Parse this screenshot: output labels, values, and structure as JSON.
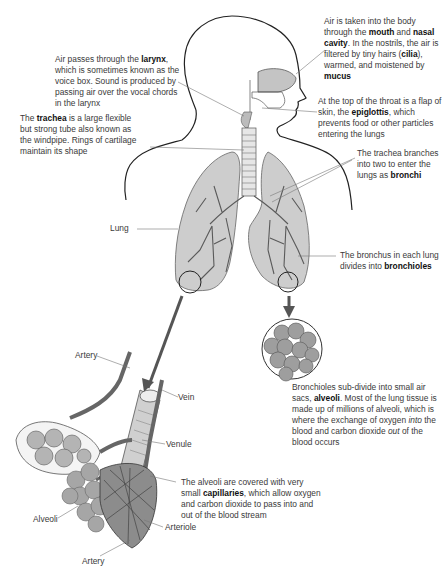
{
  "diagram": {
    "annotations": [
      {
        "id": "mouth_nasal",
        "parts": [
          {
            "t": "Air is taken into the body through the "
          },
          {
            "t": "mouth",
            "b": true
          },
          {
            "t": " and "
          },
          {
            "t": "nasal cavity",
            "b": true
          },
          {
            "t": ". In the nostrils, the air is filtered by tiny hairs ("
          },
          {
            "t": "cilia",
            "b": true
          },
          {
            "t": "), warmed, and moistened by "
          },
          {
            "t": "mucus",
            "b": true
          }
        ]
      },
      {
        "id": "larynx",
        "parts": [
          {
            "t": "Air passes through the "
          },
          {
            "t": "larynx",
            "b": true
          },
          {
            "t": ", which is sometimes known as the voice box. Sound is produced by passing air over the vocal chords in the larynx"
          }
        ]
      },
      {
        "id": "epiglottis",
        "parts": [
          {
            "t": "At the top of the throat is a flap of skin, the "
          },
          {
            "t": "epiglottis",
            "b": true
          },
          {
            "t": ", which prevents food or other particles entering the lungs"
          }
        ]
      },
      {
        "id": "trachea",
        "parts": [
          {
            "t": "The "
          },
          {
            "t": "trachea",
            "b": true
          },
          {
            "t": " is a large flexible but strong tube also known as the windpipe. Rings of cartilage maintain its shape"
          }
        ]
      },
      {
        "id": "bronchi",
        "parts": [
          {
            "t": "The trachea branches into two to enter the lungs as "
          },
          {
            "t": "bronchi",
            "b": true
          }
        ]
      },
      {
        "id": "lung",
        "parts": [
          {
            "t": "Lung"
          }
        ]
      },
      {
        "id": "bronchioles",
        "parts": [
          {
            "t": "The bronchus in each lung divides into "
          },
          {
            "t": "bronchioles",
            "b": true
          }
        ]
      },
      {
        "id": "alveoli_sacs",
        "parts": [
          {
            "t": "Bronchioles sub-divide into small air sacs, "
          },
          {
            "t": "alveoli",
            "b": true
          },
          {
            "t": ". Most of the lung tissue is made up of millions of alveoli, which is where the exchange of oxygen "
          },
          {
            "t": "into",
            "i": true
          },
          {
            "t": " the blood and carbon dioxide "
          },
          {
            "t": "out",
            "i": true
          },
          {
            "t": " of the blood occurs"
          }
        ]
      },
      {
        "id": "artery_top",
        "parts": [
          {
            "t": "Artery"
          }
        ]
      },
      {
        "id": "vein",
        "parts": [
          {
            "t": "Vein"
          }
        ]
      },
      {
        "id": "venule",
        "parts": [
          {
            "t": "Venule"
          }
        ]
      },
      {
        "id": "capillaries",
        "parts": [
          {
            "t": "The alveoli are covered with very small "
          },
          {
            "t": "capillaries",
            "b": true
          },
          {
            "t": ", which allow oxygen and carbon dioxide to pass into and out of the blood stream"
          }
        ]
      },
      {
        "id": "alveoli_label",
        "parts": [
          {
            "t": "Alveoli"
          }
        ]
      },
      {
        "id": "arteriole",
        "parts": [
          {
            "t": "Arteriole"
          }
        ]
      },
      {
        "id": "artery_bottom",
        "parts": [
          {
            "t": "Artery"
          }
        ]
      }
    ],
    "colors": {
      "outline": "#222222",
      "lung_fill": "#c8c8c8",
      "tissue": "#9a9a9a",
      "text": "#3a3a3a",
      "leader": "#777777"
    }
  }
}
